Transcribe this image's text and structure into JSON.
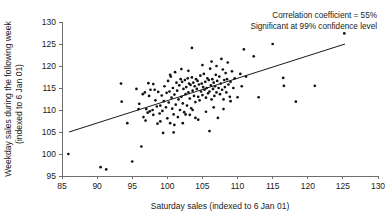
{
  "chart_data": {
    "type": "scatter",
    "title": "",
    "xlabel": "Saturday sales (indexed to 6 Jan 01)",
    "ylabel": "Weekday sales during the following week (indexed to 6 Jan 01)",
    "ylabel_line1": "Weekday sales during the following week",
    "ylabel_line2": "(indexed to 6 Jan 01)",
    "xlim": [
      85,
      130
    ],
    "ylim": [
      95,
      130
    ],
    "xticks": [
      85,
      90,
      95,
      100,
      105,
      110,
      115,
      120,
      125,
      130
    ],
    "yticks": [
      95,
      100,
      105,
      110,
      115,
      120,
      125,
      130
    ],
    "grid": false,
    "legend": null,
    "annotations": [
      "Correlation coefficient = 55%",
      "Significant at 99% confidence level"
    ],
    "correlation_coefficient_pct": 55,
    "significance_confidence_pct": 99,
    "trendline": {
      "label": "linear fit",
      "x": [
        86.0,
        125.3
      ],
      "y": [
        105.0,
        125.0
      ]
    },
    "marker_color": "#111111",
    "line_color": "#1a1a1a",
    "axis_color": "#6e6e6e",
    "points": [
      [
        85.9,
        100.0
      ],
      [
        90.5,
        97.0
      ],
      [
        91.3,
        96.5
      ],
      [
        93.4,
        116.0
      ],
      [
        93.5,
        111.9
      ],
      [
        94.3,
        107.0
      ],
      [
        95.0,
        98.3
      ],
      [
        95.6,
        114.8
      ],
      [
        96.0,
        111.4
      ],
      [
        96.3,
        101.7
      ],
      [
        96.5,
        113.6
      ],
      [
        96.6,
        108.4
      ],
      [
        96.8,
        114.0
      ],
      [
        97.0,
        110.2
      ],
      [
        97.2,
        109.4
      ],
      [
        97.4,
        113.2
      ],
      [
        97.5,
        109.7
      ],
      [
        97.6,
        114.6
      ],
      [
        97.9,
        110.0
      ],
      [
        98.0,
        108.9
      ],
      [
        98.2,
        114.6
      ],
      [
        98.3,
        112.2
      ],
      [
        98.5,
        110.8
      ],
      [
        98.7,
        114.1
      ],
      [
        98.9,
        109.2
      ],
      [
        99.0,
        111.0
      ],
      [
        99.2,
        113.3
      ],
      [
        99.3,
        109.8
      ],
      [
        99.5,
        112.0
      ],
      [
        99.6,
        115.4
      ],
      [
        99.8,
        110.6
      ],
      [
        99.9,
        113.9
      ],
      [
        100.0,
        108.1
      ],
      [
        100.1,
        116.6
      ],
      [
        100.2,
        111.7
      ],
      [
        100.3,
        114.2
      ],
      [
        100.4,
        107.0
      ],
      [
        100.5,
        117.6
      ],
      [
        100.6,
        112.8
      ],
      [
        100.7,
        110.3
      ],
      [
        100.8,
        115.0
      ],
      [
        100.9,
        109.0
      ],
      [
        101.0,
        113.5
      ],
      [
        101.1,
        118.6
      ],
      [
        101.2,
        111.2
      ],
      [
        101.3,
        116.2
      ],
      [
        101.4,
        114.4
      ],
      [
        101.5,
        108.4
      ],
      [
        101.6,
        112.4
      ],
      [
        101.7,
        115.6
      ],
      [
        101.8,
        110.0
      ],
      [
        101.9,
        117.0
      ],
      [
        102.0,
        113.0
      ],
      [
        102.1,
        116.4
      ],
      [
        102.2,
        111.5
      ],
      [
        102.3,
        114.8
      ],
      [
        102.4,
        109.5
      ],
      [
        102.5,
        116.8
      ],
      [
        102.6,
        113.6
      ],
      [
        102.7,
        115.2
      ],
      [
        102.8,
        111.0
      ],
      [
        102.9,
        117.2
      ],
      [
        103.0,
        114.0
      ],
      [
        103.1,
        116.0
      ],
      [
        103.2,
        112.6
      ],
      [
        103.3,
        115.7
      ],
      [
        103.4,
        110.4
      ],
      [
        103.5,
        117.4
      ],
      [
        103.5,
        124.1
      ],
      [
        103.6,
        114.4
      ],
      [
        103.7,
        116.2
      ],
      [
        103.8,
        113.2
      ],
      [
        103.9,
        115.4
      ],
      [
        104.0,
        111.8
      ],
      [
        104.1,
        117.0
      ],
      [
        104.2,
        114.8
      ],
      [
        104.3,
        116.6
      ],
      [
        104.4,
        113.0
      ],
      [
        104.5,
        115.8
      ],
      [
        104.6,
        112.2
      ],
      [
        104.7,
        117.8
      ],
      [
        104.8,
        114.2
      ],
      [
        104.9,
        116.0
      ],
      [
        105.0,
        113.4
      ],
      [
        105.1,
        115.2
      ],
      [
        105.2,
        118.2
      ],
      [
        105.3,
        114.6
      ],
      [
        105.4,
        116.4
      ],
      [
        105.5,
        112.8
      ],
      [
        105.6,
        115.0
      ],
      [
        105.7,
        117.2
      ],
      [
        105.8,
        113.8
      ],
      [
        105.9,
        116.8
      ],
      [
        106.0,
        105.2
      ],
      [
        106.0,
        114.2
      ],
      [
        106.1,
        119.4
      ],
      [
        106.2,
        115.6
      ],
      [
        106.3,
        112.4
      ],
      [
        106.4,
        117.0
      ],
      [
        106.5,
        114.8
      ],
      [
        106.6,
        116.2
      ],
      [
        106.7,
        113.2
      ],
      [
        106.8,
        115.4
      ],
      [
        106.9,
        118.0
      ],
      [
        107.0,
        114.0
      ],
      [
        107.1,
        116.6
      ],
      [
        107.2,
        108.2
      ],
      [
        107.3,
        115.0
      ],
      [
        107.4,
        117.6
      ],
      [
        107.5,
        113.6
      ],
      [
        107.6,
        116.0
      ],
      [
        107.7,
        121.6
      ],
      [
        107.8,
        114.6
      ],
      [
        107.9,
        119.2
      ],
      [
        108.0,
        112.4
      ],
      [
        108.1,
        116.8
      ],
      [
        108.2,
        115.2
      ],
      [
        108.3,
        118.4
      ],
      [
        108.4,
        114.0
      ],
      [
        108.5,
        117.0
      ],
      [
        108.6,
        120.8
      ],
      [
        108.7,
        115.8
      ],
      [
        108.9,
        113.0
      ],
      [
        109.0,
        116.4
      ],
      [
        109.2,
        118.8
      ],
      [
        109.4,
        115.0
      ],
      [
        109.6,
        117.2
      ],
      [
        110.0,
        112.9
      ],
      [
        110.4,
        118.2
      ],
      [
        110.6,
        115.4
      ],
      [
        110.9,
        123.8
      ],
      [
        111.2,
        117.6
      ],
      [
        112.3,
        122.2
      ],
      [
        113.0,
        112.9
      ],
      [
        115.0,
        125.0
      ],
      [
        116.5,
        117.3
      ],
      [
        116.6,
        115.5
      ],
      [
        118.3,
        111.9
      ],
      [
        121.0,
        115.5
      ],
      [
        125.2,
        127.4
      ],
      [
        99.4,
        104.8
      ],
      [
        102.2,
        107.0
      ],
      [
        104.0,
        108.2
      ],
      [
        99.0,
        107.4
      ],
      [
        100.4,
        118.0
      ],
      [
        102.0,
        119.3
      ],
      [
        103.0,
        118.9
      ],
      [
        105.0,
        120.2
      ],
      [
        106.3,
        121.0
      ],
      [
        107.0,
        120.0
      ],
      [
        98.0,
        115.9
      ],
      [
        97.3,
        116.1
      ],
      [
        95.9,
        110.2
      ],
      [
        96.9,
        107.6
      ],
      [
        98.6,
        106.9
      ],
      [
        101.0,
        106.6
      ],
      [
        103.2,
        108.9
      ],
      [
        104.4,
        107.8
      ],
      [
        105.5,
        109.6
      ],
      [
        106.6,
        110.6
      ],
      [
        108.0,
        110.2
      ],
      [
        109.0,
        112.0
      ],
      [
        100.9,
        104.9
      ],
      [
        103.6,
        110.0
      ],
      [
        102.6,
        109.0
      ]
    ]
  }
}
